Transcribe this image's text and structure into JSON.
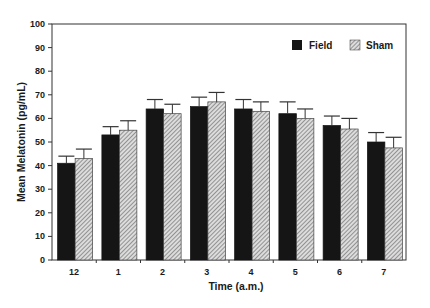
{
  "chart_data": {
    "type": "bar",
    "title": "",
    "xlabel": "Time (a.m.)",
    "ylabel": "Mean Melatonin (pg/mL)",
    "ylim": [
      0,
      100
    ],
    "yticks": [
      0,
      10,
      20,
      30,
      40,
      50,
      60,
      70,
      80,
      90,
      100
    ],
    "grid": false,
    "legend_position": "upper right",
    "categories": [
      "12",
      "1",
      "2",
      "3",
      "4",
      "5",
      "6",
      "7"
    ],
    "series": [
      {
        "name": "Field",
        "fill": "solid black",
        "values": [
          41,
          53,
          64,
          65,
          64,
          62,
          57,
          50
        ],
        "error_upper": [
          44,
          56.5,
          68,
          69,
          68,
          67,
          61,
          54
        ]
      },
      {
        "name": "Sham",
        "fill": "diagonal hatch",
        "values": [
          43,
          55,
          62,
          67,
          63,
          60,
          55.5,
          47.5
        ],
        "error_upper": [
          47,
          59,
          66,
          71,
          67,
          64,
          60,
          52
        ]
      }
    ]
  },
  "legend": {
    "items": [
      {
        "label": "Field"
      },
      {
        "label": "Sham"
      }
    ]
  },
  "colors": {
    "field": "#151515",
    "sham_bg": "#d9d9d9",
    "sham_hatch": "#555555",
    "axis": "#333333"
  }
}
